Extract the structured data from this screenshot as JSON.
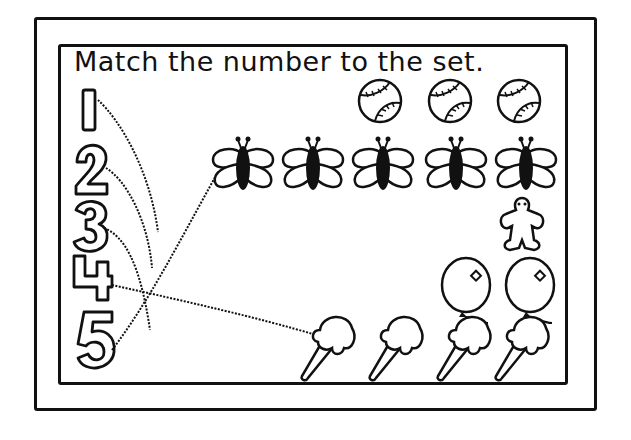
{
  "worksheet": {
    "title": "Match the number to the set.",
    "numbers": [
      "1",
      "2",
      "3",
      "4",
      "5"
    ],
    "sets": [
      {
        "object": "baseball",
        "count": 3
      },
      {
        "object": "butterfly",
        "count": 5
      },
      {
        "object": "gingerbread-man",
        "count": 1
      },
      {
        "object": "balloon",
        "count": 2
      },
      {
        "object": "ice-cream-cone",
        "count": 4
      }
    ],
    "drawn_lines": [
      {
        "from": "1",
        "to": "unconnected"
      },
      {
        "from": "2",
        "to": "unconnected"
      },
      {
        "from": "3",
        "to": "unconnected"
      },
      {
        "from": "4",
        "to": "ice-cream-cone"
      },
      {
        "from": "5",
        "to": "butterfly"
      }
    ],
    "colors": {
      "ink": "#111111",
      "paper": "#ffffff"
    }
  }
}
